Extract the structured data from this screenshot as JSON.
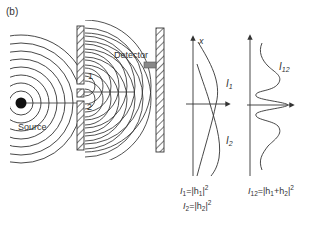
{
  "figure": {
    "panel_label": "(b)",
    "apparatus": {
      "source_label": "Source",
      "detector_label": "Detector",
      "slit1_label": "1",
      "slit2_label": "2"
    },
    "graph1": {
      "axis_label": "x",
      "curve1_label": "I",
      "curve1_sub": "1",
      "curve2_label": "I",
      "curve2_sub": "2",
      "formula1": {
        "lhs": "I",
        "lhs_sub": "1",
        "eq": "=|h",
        "h_sub": "1",
        "tail": "|",
        "pow": "2"
      },
      "formula2": {
        "lhs": "I",
        "lhs_sub": "2",
        "eq": "=|h",
        "h_sub": "2",
        "tail": "|",
        "pow": "2"
      }
    },
    "graph2": {
      "curve_label": "I",
      "curve_sub": "12",
      "formula": {
        "lhs": "I",
        "lhs_sub": "12",
        "eq": "=|h",
        "h1_sub": "1",
        "plus": "+h",
        "h2_sub": "2",
        "tail": "|",
        "pow": "2"
      }
    },
    "colors": {
      "line": "#333333",
      "detector": "#888888",
      "source": "#111111"
    }
  }
}
